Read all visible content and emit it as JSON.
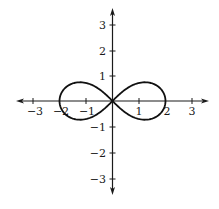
{
  "chart_data": {
    "type": "line",
    "title": "",
    "xlabel": "",
    "ylabel": "",
    "xlim": [
      -3.5,
      3.6
    ],
    "ylim": [
      -3.5,
      3.5
    ],
    "grid": false,
    "legend": null,
    "x_ticks": [
      -3,
      -2,
      -1,
      1,
      2,
      3
    ],
    "y_ticks": [
      -3,
      -2,
      -1,
      1,
      2,
      3
    ],
    "x_tick_labels": [
      "−3",
      "−2",
      "−1",
      "1",
      "2",
      "3"
    ],
    "y_tick_labels": [
      "−3",
      "−2",
      "−1",
      "1",
      "2",
      "3"
    ],
    "series": [
      {
        "name": "lemniscate",
        "equation": "(x^2+y^2)^2 = 4(x^2 - y^2)",
        "color": "#111111",
        "points": [
          [
            2,
            0
          ],
          [
            1.81,
            0.47
          ],
          [
            1.39,
            0.69
          ],
          [
            0.94,
            0.67
          ],
          [
            0.57,
            0.49
          ],
          [
            0.27,
            0.26
          ],
          [
            0,
            0
          ],
          [
            -0.27,
            -0.26
          ],
          [
            -0.57,
            -0.49
          ],
          [
            -0.94,
            -0.67
          ],
          [
            -1.39,
            -0.69
          ],
          [
            -1.81,
            -0.47
          ],
          [
            -2,
            0
          ],
          [
            -1.81,
            0.47
          ],
          [
            -1.39,
            0.69
          ],
          [
            -0.94,
            0.67
          ],
          [
            -0.57,
            0.49
          ],
          [
            -0.27,
            0.26
          ],
          [
            0,
            0
          ],
          [
            0.27,
            -0.26
          ],
          [
            0.57,
            -0.49
          ],
          [
            0.94,
            -0.67
          ],
          [
            1.39,
            -0.69
          ],
          [
            1.81,
            -0.47
          ],
          [
            2,
            0
          ]
        ]
      }
    ]
  },
  "axes": {
    "x_labels": [
      "−3",
      "−2",
      "−1",
      "1",
      "2",
      "3"
    ],
    "y_labels": [
      "3",
      "2",
      "1",
      "−1",
      "−2",
      "−3"
    ]
  }
}
